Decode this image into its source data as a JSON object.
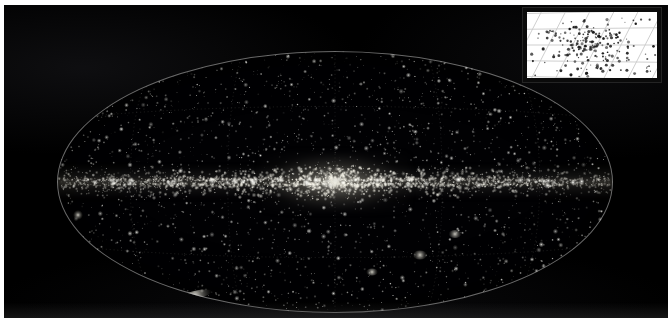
{
  "figure": {
    "projection": "aitoff",
    "background_color": "#000000",
    "plate": {
      "x": 4,
      "y": 5,
      "width": 664,
      "height": 313
    },
    "ellipse": {
      "cx": 333,
      "cy": 180,
      "rx": 278,
      "ry": 131,
      "outline_color": "#bebebe"
    },
    "graticule": {
      "visible": true,
      "color": "#9a9a9a",
      "meridian_step_deg": 30,
      "parallel_step_deg": 30
    }
  },
  "inset": {
    "name": "zoomed-region-inset",
    "x": 523,
    "y": 8,
    "width": 138,
    "height": 74,
    "background_color": "#ffffff",
    "frame_color": "#0b0b0b",
    "grid_color": "#c9c9c9",
    "point_color": "#1a1a1a",
    "grid": {
      "diagonal_lines": 7,
      "horizontal_lines": 4,
      "skew_deg": 66
    }
  },
  "caption": {
    "left_text": "",
    "right_text": ""
  },
  "chart_data": {
    "type": "scatter",
    "xlabel": "Galactic longitude",
    "ylabel": "Galactic latitude",
    "xlim": [
      180,
      -180
    ],
    "ylim": [
      -90,
      90
    ],
    "grid": true,
    "legend": "none",
    "series": [
      {
        "name": "galactic-plane-sources",
        "marker": "point",
        "color": "#ffffff",
        "count": 1400,
        "description": "Dense bright band concentrated at |b| < 3 deg with a strong bulge at the galactic center"
      },
      {
        "name": "high-latitude-sources",
        "marker": "point",
        "color": "#d8d8d8",
        "count": 1900,
        "description": "Sparse isotropic scatter of faint sources across the whole sky"
      },
      {
        "name": "extended-objects",
        "marker": "diffuse-patch",
        "color": "#e8e6dc",
        "count": 6,
        "points": [
          {
            "label": "extended-source-lower-left",
            "x_px": 195,
            "y_px": 295,
            "w_px": 34,
            "h_px": 8
          },
          {
            "label": "extended-source-left-edge",
            "x_px": 78,
            "y_px": 215,
            "w_px": 10,
            "h_px": 10
          },
          {
            "label": "extended-source-lower-right-a",
            "x_px": 420,
            "y_px": 255,
            "w_px": 14,
            "h_px": 9
          },
          {
            "label": "extended-source-lower-right-b",
            "x_px": 455,
            "y_px": 234,
            "w_px": 13,
            "h_px": 8
          },
          {
            "label": "extended-source-center-bulge",
            "x_px": 335,
            "y_px": 183,
            "w_px": 16,
            "h_px": 10
          },
          {
            "label": "extended-source-lower-center",
            "x_px": 372,
            "y_px": 272,
            "w_px": 12,
            "h_px": 7
          }
        ]
      }
    ],
    "inset_chart": {
      "type": "scatter",
      "title": "",
      "xlabel": "",
      "ylabel": "",
      "grid": true,
      "point_count": 210,
      "description": "Magnified white-background view of the central cluster region with skewed coordinate grid"
    }
  }
}
